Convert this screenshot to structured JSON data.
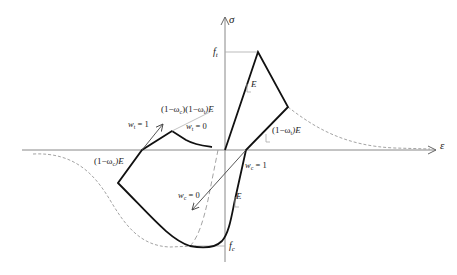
{
  "diagram": {
    "axes": {
      "y_label": "σ",
      "x_label": "ε"
    },
    "levels": {
      "tensile_strength": "f",
      "tensile_strength_sub": "t",
      "compressive_strength": "f",
      "compressive_strength_sub": "c"
    },
    "slopes": {
      "initial_tension": "E",
      "initial_compression": "E",
      "tension_unloading": "(1−ω",
      "tension_unloading_sub": "t",
      "tension_unloading_end": ")E",
      "compression_unloading": "(1−ω",
      "compression_unloading_sub": "c",
      "compression_unloading_end": ")E",
      "combined_a": "(1−ω",
      "combined_a_sub": "c",
      "combined_b": ")(1−ω",
      "combined_b_sub": "t",
      "combined_c": ")E"
    },
    "weights": {
      "wt1_base": "w",
      "wt1_sub": "t",
      "wt1_val": " = 1",
      "wt0_base": "w",
      "wt0_sub": "t",
      "wt0_val": " = 0",
      "wc1_base": "w",
      "wc1_sub": "c",
      "wc1_val": " = 1",
      "wc0_base": "w",
      "wc0_sub": "c",
      "wc0_val": " = 0"
    },
    "colors": {
      "axis": "#888888",
      "curve": "#111111",
      "dashed": "#999999",
      "guide": "#aaaaaa"
    }
  }
}
